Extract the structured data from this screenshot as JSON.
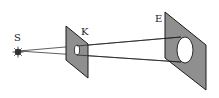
{
  "diagram": {
    "type": "optics-pinhole-projection",
    "labels": {
      "source": "S",
      "aperture_plate": "K",
      "screen": "E"
    },
    "colors": {
      "plate_fill": "#8f8f8f",
      "stroke": "#1a1a1a",
      "hole_fill": "#ffffff",
      "background": "#ffffff"
    }
  }
}
